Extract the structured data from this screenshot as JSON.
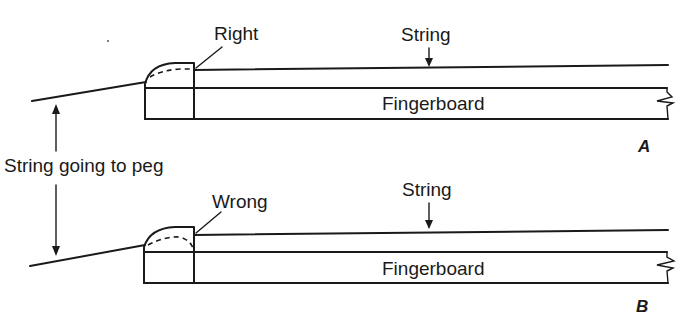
{
  "figure": {
    "colors": {
      "ink": "#1a1a1a",
      "background": "#ffffff"
    }
  },
  "shared": {
    "peg_label": "String going to peg"
  },
  "panels": [
    {
      "id": "A",
      "panel_label": "A",
      "nut_label": "Right",
      "string_label": "String",
      "fingerboard_label": "Fingerboard",
      "verdict": "correct"
    },
    {
      "id": "B",
      "panel_label": "B",
      "nut_label": "Wrong",
      "string_label": "String",
      "fingerboard_label": "Fingerboard",
      "verdict": "incorrect"
    }
  ]
}
